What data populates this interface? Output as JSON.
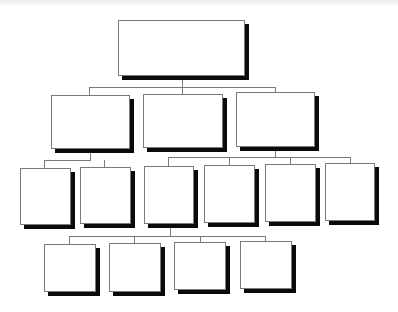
{
  "diagram": {
    "type": "org-chart",
    "colors": {
      "box_fill": "#ffffff",
      "box_border": "#7a7a7a",
      "shadow": "#0a0a0a",
      "connector": "#7a7a7a",
      "background": "#ffffff"
    },
    "nodes": [
      {
        "id": "n0",
        "level": 0,
        "label": "",
        "x": 118,
        "y": 20,
        "w": 127,
        "h": 56
      },
      {
        "id": "n1",
        "level": 1,
        "parent": "n0",
        "label": "",
        "x": 51,
        "y": 95,
        "w": 79,
        "h": 54
      },
      {
        "id": "n2",
        "level": 1,
        "parent": "n0",
        "label": "",
        "x": 143,
        "y": 94,
        "w": 80,
        "h": 54
      },
      {
        "id": "n3",
        "level": 1,
        "parent": "n0",
        "label": "",
        "x": 236,
        "y": 92,
        "w": 79,
        "h": 55
      },
      {
        "id": "n4",
        "level": 2,
        "parent": "n1",
        "label": "",
        "x": 20,
        "y": 168,
        "w": 51,
        "h": 57
      },
      {
        "id": "n5",
        "level": 2,
        "parent": "n1",
        "label": "",
        "x": 80,
        "y": 167,
        "w": 51,
        "h": 57
      },
      {
        "id": "n6",
        "level": 2,
        "parent": "n3",
        "label": "",
        "x": 144,
        "y": 166,
        "w": 50,
        "h": 58
      },
      {
        "id": "n7",
        "level": 2,
        "parent": "n3",
        "label": "",
        "x": 204,
        "y": 165,
        "w": 51,
        "h": 58
      },
      {
        "id": "n8",
        "level": 2,
        "parent": "n3",
        "label": "",
        "x": 265,
        "y": 164,
        "w": 51,
        "h": 58
      },
      {
        "id": "n9",
        "level": 2,
        "parent": "n3",
        "label": "",
        "x": 325,
        "y": 163,
        "w": 50,
        "h": 58
      },
      {
        "id": "n10",
        "level": 3,
        "parent": "n6",
        "label": "",
        "x": 44,
        "y": 244,
        "w": 52,
        "h": 48
      },
      {
        "id": "n11",
        "level": 3,
        "parent": "n6",
        "label": "",
        "x": 109,
        "y": 243,
        "w": 52,
        "h": 49
      },
      {
        "id": "n12",
        "level": 3,
        "parent": "n6",
        "label": "",
        "x": 174,
        "y": 242,
        "w": 52,
        "h": 48
      },
      {
        "id": "n13",
        "level": 3,
        "parent": "n6",
        "label": "",
        "x": 240,
        "y": 241,
        "w": 52,
        "h": 48
      }
    ],
    "connectors": [
      {
        "x": 182,
        "y": 79,
        "w": 1,
        "h": 8
      },
      {
        "x": 89,
        "y": 87,
        "w": 187,
        "h": 1
      },
      {
        "x": 89,
        "y": 87,
        "w": 1,
        "h": 8
      },
      {
        "x": 182,
        "y": 87,
        "w": 1,
        "h": 7
      },
      {
        "x": 275,
        "y": 87,
        "w": 1,
        "h": 5
      },
      {
        "x": 90,
        "y": 152,
        "w": 1,
        "h": 8
      },
      {
        "x": 44,
        "y": 160,
        "w": 47,
        "h": 1
      },
      {
        "x": 44,
        "y": 160,
        "w": 1,
        "h": 8
      },
      {
        "x": 104,
        "y": 160,
        "w": 1,
        "h": 7
      },
      {
        "x": 275,
        "y": 150,
        "w": 1,
        "h": 7
      },
      {
        "x": 168,
        "y": 157,
        "w": 183,
        "h": 1
      },
      {
        "x": 168,
        "y": 157,
        "w": 1,
        "h": 9
      },
      {
        "x": 229,
        "y": 157,
        "w": 1,
        "h": 8
      },
      {
        "x": 290,
        "y": 157,
        "w": 1,
        "h": 7
      },
      {
        "x": 350,
        "y": 157,
        "w": 1,
        "h": 6
      },
      {
        "x": 170,
        "y": 227,
        "w": 1,
        "h": 9
      },
      {
        "x": 69,
        "y": 236,
        "w": 197,
        "h": 1
      },
      {
        "x": 69,
        "y": 236,
        "w": 1,
        "h": 8
      },
      {
        "x": 134,
        "y": 236,
        "w": 1,
        "h": 7
      },
      {
        "x": 200,
        "y": 236,
        "w": 1,
        "h": 6
      },
      {
        "x": 265,
        "y": 236,
        "w": 1,
        "h": 5
      }
    ]
  }
}
